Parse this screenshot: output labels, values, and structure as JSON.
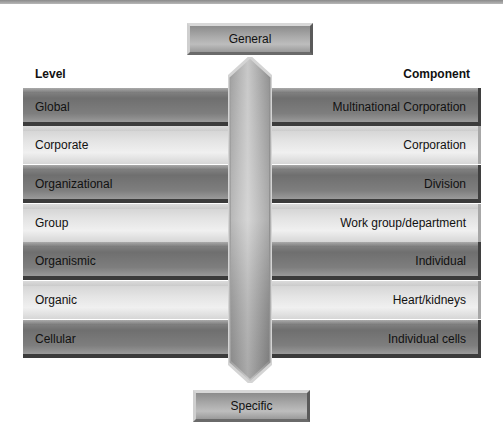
{
  "headers": {
    "level": "Level",
    "component": "Component"
  },
  "top_box": {
    "label": "General"
  },
  "bottom_box": {
    "label": "Specific"
  },
  "rows": [
    {
      "level": "Global",
      "component": "Multinational Corporation",
      "shade": "dark"
    },
    {
      "level": "Corporate",
      "component": "Corporation",
      "shade": "light"
    },
    {
      "level": "Organizational",
      "component": "Division",
      "shade": "dark"
    },
    {
      "level": "Group",
      "component": "Work group/department",
      "shade": "light"
    },
    {
      "level": "Organismic",
      "component": "Individual",
      "shade": "dark"
    },
    {
      "level": "Organic",
      "component": "Heart/kidneys",
      "shade": "light"
    },
    {
      "level": "Cellular",
      "component": "Individual cells",
      "shade": "dark"
    }
  ],
  "colors": {
    "dark_row": "#7a7a7a",
    "light_row": "#e2e2e2",
    "column": "#b0b0b0"
  }
}
